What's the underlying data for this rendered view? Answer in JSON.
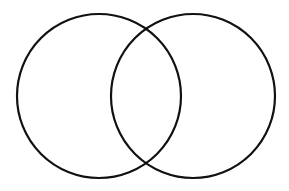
{
  "diagram": {
    "type": "venn",
    "background": "#ffffff",
    "stroke_color": "#111111",
    "circles": [
      {
        "name": "left",
        "cx": 99,
        "cy": 96,
        "r": 82
      },
      {
        "name": "right",
        "cx": 193,
        "cy": 96,
        "r": 82
      }
    ],
    "labels": []
  }
}
